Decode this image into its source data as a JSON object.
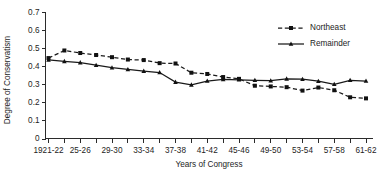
{
  "chart_data": {
    "type": "line",
    "title": "",
    "xlabel": "Years of Congress",
    "ylabel": "Degree of Conservatism",
    "ylim": [
      0,
      0.7
    ],
    "ytick_labels": [
      "0",
      "0.1",
      "0.2",
      "0.3",
      "0.4",
      "0.5",
      "0.6",
      "0.7"
    ],
    "ytick_values": [
      0,
      0.1,
      0.2,
      0.3,
      0.4,
      0.5,
      0.6,
      0.7
    ],
    "grid": false,
    "legend_position": "top-right",
    "categories": [
      "1921-22",
      "23-24",
      "25-26",
      "27-28",
      "29-30",
      "31-32",
      "33-34",
      "35-36",
      "37-38",
      "39-40",
      "41-42",
      "43-44",
      "45-46",
      "47-48",
      "49-50",
      "51-52",
      "53-54",
      "55-56",
      "57-58",
      "59-60",
      "61-62"
    ],
    "xtick_labels_shown": [
      "1921-22",
      "25-26",
      "29-30",
      "33-34",
      "37-38",
      "41-42",
      "45-46",
      "49-50",
      "53-54",
      "57-58",
      "61-62"
    ],
    "series": [
      {
        "name": "Northeast",
        "style": "dashed",
        "marker": "square",
        "values": [
          0.445,
          0.487,
          0.473,
          0.462,
          0.45,
          0.437,
          0.434,
          0.417,
          0.415,
          0.364,
          0.357,
          0.34,
          0.33,
          0.292,
          0.288,
          0.284,
          0.265,
          0.282,
          0.267,
          0.228,
          0.222
        ]
      },
      {
        "name": "Remainder",
        "style": "solid",
        "marker": "triangle",
        "values": [
          0.435,
          0.427,
          0.42,
          0.406,
          0.392,
          0.382,
          0.373,
          0.365,
          0.312,
          0.297,
          0.318,
          0.327,
          0.325,
          0.322,
          0.32,
          0.33,
          0.328,
          0.317,
          0.3,
          0.322,
          0.318
        ]
      }
    ]
  },
  "legend": {
    "entries": [
      {
        "label": "Northeast"
      },
      {
        "label": "Remainder"
      }
    ]
  },
  "colors": {
    "ink": "#1a1a1a",
    "background": "#ffffff"
  }
}
